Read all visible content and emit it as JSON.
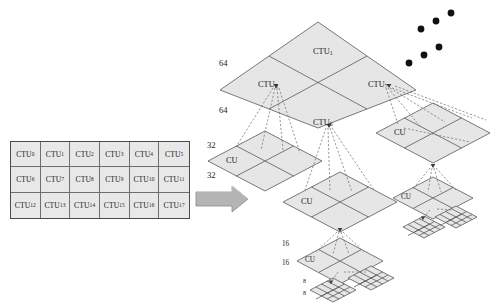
{
  "diagram": {
    "colors": {
      "block_fill": "#e6e6e6",
      "block_stroke": "#595959",
      "dashed_stroke": "#6b6b6b",
      "arrow_fill": "#b0b0b0",
      "arrow_stroke": "#7a7a7a",
      "dot_fill": "#111111",
      "text": "#1a1a1a"
    }
  },
  "ctu_grid": {
    "name": "CTU picture partition grid",
    "rows": 3,
    "cols": 6,
    "cells": [
      {
        "base": "CTU",
        "index": "0"
      },
      {
        "base": "CTU",
        "index": "1"
      },
      {
        "base": "CTU",
        "index": "2"
      },
      {
        "base": "CTU",
        "index": "3"
      },
      {
        "base": "CTU",
        "index": "4"
      },
      {
        "base": "CTU",
        "index": "5"
      },
      {
        "base": "CTU",
        "index": "6"
      },
      {
        "base": "CTU",
        "index": "7"
      },
      {
        "base": "CTU",
        "index": "8"
      },
      {
        "base": "CTU",
        "index": "9"
      },
      {
        "base": "CTU",
        "index": "10"
      },
      {
        "base": "CTU",
        "index": "11"
      },
      {
        "base": "CTU",
        "index": "12"
      },
      {
        "base": "CTU",
        "index": "13"
      },
      {
        "base": "CTU",
        "index": "14"
      },
      {
        "base": "CTU",
        "index": "15"
      },
      {
        "base": "CTU",
        "index": "16"
      },
      {
        "base": "CTU",
        "index": "17"
      }
    ]
  },
  "arrow": {
    "label": "",
    "direction": "right"
  },
  "tree": {
    "level0": {
      "size_labels": [
        "64",
        "64"
      ],
      "cells": [
        {
          "base": "CTU",
          "index": "1",
          "position": "top"
        },
        {
          "base": "CTU",
          "index": "0",
          "position": "left"
        },
        {
          "base": "CTU",
          "index": "7",
          "position": "right"
        },
        {
          "base": "CTU",
          "index": "6",
          "position": "bottom"
        }
      ]
    },
    "level1_left": {
      "label": "CU",
      "size_labels": [
        "32",
        "32"
      ]
    },
    "level1_center": {
      "label": "CU"
    },
    "level1_right": {
      "label": "CU"
    },
    "level2_center": {
      "label": "CU",
      "size_labels": [
        "16",
        "16"
      ]
    },
    "level2_right": {
      "label": "CU"
    },
    "level3_center": {
      "size_labels": [
        "8",
        "8"
      ]
    }
  },
  "ellipsis": {
    "group_upper": {
      "dots": 3
    },
    "group_lower": {
      "dots": 3
    }
  }
}
